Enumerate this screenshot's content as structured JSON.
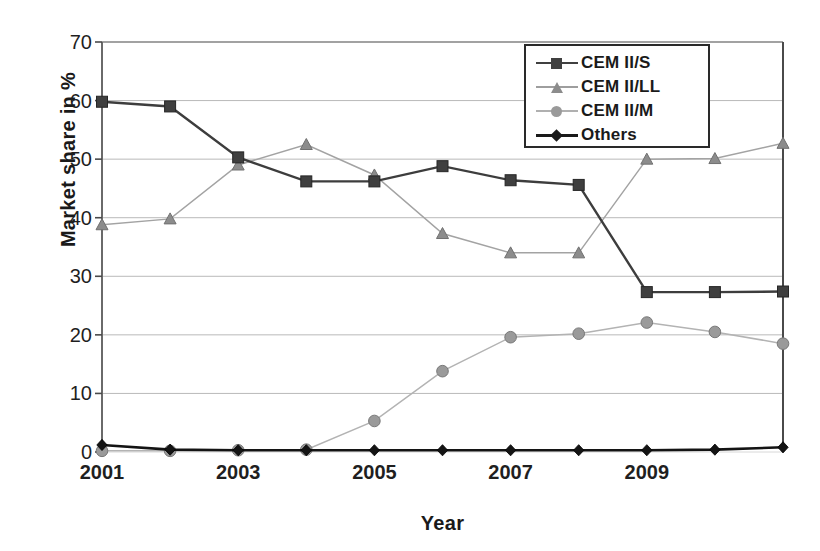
{
  "chart_data": {
    "type": "line",
    "title": "",
    "xlabel": "Year",
    "ylabel": "Market share in %",
    "x": [
      2001,
      2002,
      2003,
      2004,
      2005,
      2006,
      2007,
      2008,
      2009,
      2010,
      2011
    ],
    "x_tick_labels": [
      "2001",
      "",
      "2003",
      "",
      "2005",
      "",
      "2007",
      "",
      "2009",
      "",
      ""
    ],
    "y_tick_labels": [
      "0",
      "10",
      "20",
      "30",
      "40",
      "50",
      "60",
      "70"
    ],
    "y_ticks": [
      0,
      10,
      20,
      30,
      40,
      50,
      60,
      70
    ],
    "ylim": [
      0,
      70
    ],
    "xlim": [
      2001,
      2011
    ],
    "grid": "horizontal",
    "legend_position": "top-right",
    "series": [
      {
        "name": "CEM II/S",
        "marker": "square",
        "color": "#404040",
        "values": [
          59.8,
          59.0,
          50.3,
          46.2,
          46.2,
          48.8,
          46.4,
          45.6,
          27.3,
          27.3,
          27.4
        ]
      },
      {
        "name": "CEM II/LL",
        "marker": "triangle",
        "color": "#8c8c8c",
        "values": [
          38.8,
          39.8,
          49.0,
          52.5,
          47.3,
          37.3,
          34.0,
          34.0,
          50.0,
          50.1,
          52.7
        ]
      },
      {
        "name": "CEM II/M",
        "marker": "circle",
        "color": "#9a9a9a",
        "values": [
          0.2,
          0.2,
          0.3,
          0.4,
          5.3,
          13.8,
          19.6,
          20.2,
          22.1,
          20.5,
          18.5
        ]
      },
      {
        "name": "Others",
        "marker": "diamond",
        "color": "#1a1a1a",
        "values": [
          1.2,
          0.4,
          0.3,
          0.3,
          0.3,
          0.3,
          0.3,
          0.3,
          0.3,
          0.4,
          0.8
        ]
      }
    ]
  },
  "legend": {
    "entries": [
      {
        "label": "CEM II/S"
      },
      {
        "label": "CEM II/LL"
      },
      {
        "label": "CEM II/M"
      },
      {
        "label": "Others"
      }
    ]
  },
  "axes": {
    "y_title": "Market share in %",
    "x_title": "Year"
  }
}
